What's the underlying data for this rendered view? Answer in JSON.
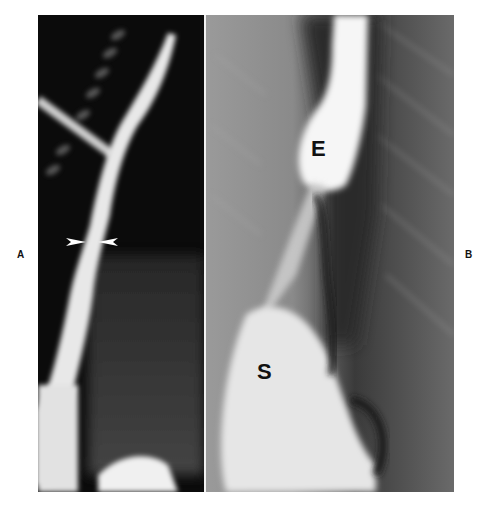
{
  "figure": {
    "panels": [
      {
        "id": "A",
        "side_label": "A",
        "description": "Barium swallow radiograph, oblique view; arrowheads indicate a narrowing at the distal esophagus",
        "annotations": [
          {
            "type": "arrowhead",
            "direction": "right",
            "icon": "arrowhead-right-icon"
          },
          {
            "type": "arrowhead",
            "direction": "left",
            "icon": "arrowhead-left-icon"
          }
        ]
      },
      {
        "id": "B",
        "side_label": "B",
        "description": "Barium radiograph showing dilated esophagus above the gastroesophageal junction emptying into the stomach",
        "annotations": [
          {
            "type": "text",
            "label": "E",
            "meaning": "esophagus"
          },
          {
            "type": "text",
            "label": "S",
            "meaning": "stomach"
          }
        ]
      }
    ],
    "colors": {
      "background": "#ffffff",
      "label_text": "#111111",
      "panel_a_base": "#0b0b0b",
      "panel_b_base": "#6e6e6e",
      "barium": "#f4f4f4"
    }
  }
}
